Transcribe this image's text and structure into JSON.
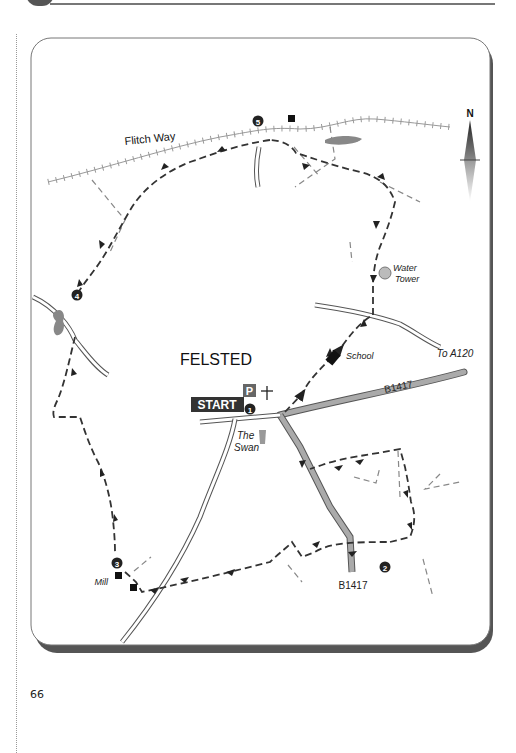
{
  "page": {
    "number": "66"
  },
  "map": {
    "title": "FELSTED",
    "labels": {
      "flitch_way": "Flitch Way",
      "water_tower": [
        "Water",
        "Tower"
      ],
      "school": "School",
      "to_a120": "To A120",
      "b1417_east": "B1417",
      "b1417_south": "B1417",
      "start": "START",
      "parking": "P",
      "the_swan": [
        "The",
        "Swan"
      ],
      "mill": "Mill",
      "north": "N"
    },
    "waypoints": [
      "1",
      "2",
      "3",
      "4",
      "5"
    ],
    "colors": {
      "route": "#333333",
      "footpath": "#888888",
      "b_road_fill": "#aaaaaa",
      "water": "#888888",
      "railway_path": "#999999",
      "frame_shadow": "#555555"
    }
  }
}
